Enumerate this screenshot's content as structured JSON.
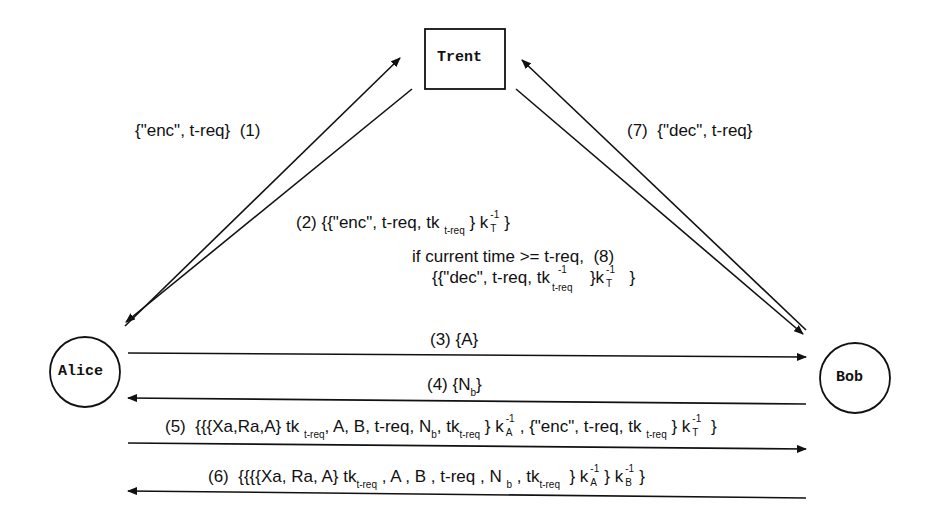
{
  "diagram": {
    "nodes": {
      "trent": "Trent",
      "alice": "Alice",
      "bob": "Bob"
    },
    "messages": {
      "m1": {
        "num": "(1)",
        "text": "{\"enc\", t-req}"
      },
      "m2": {
        "num": "(2)",
        "pre": "{{\"enc\", t-req, tk",
        "sub": "t-req",
        "mid": "} k",
        "ksup": "-1",
        "ksub": "T",
        "post": "}"
      },
      "m3": {
        "num": "(3)",
        "text": "{A}"
      },
      "m4": {
        "num": "(4)",
        "pre": "{N",
        "sub": "b",
        "post": "}"
      },
      "m5": {
        "num": "(5)",
        "p1": "{{{Xa,Ra,A} tk",
        "s1": "t-req",
        "p2": ", A, B, t-req, N",
        "s2": "b",
        "p3": ", tk",
        "s3": "t-req",
        "p4": "} k",
        "k1sup": "-1",
        "k1sub": "A",
        "p5": ", {\"enc\", t-req, tk",
        "s4": "t-req",
        "p6": "} k",
        "k2sup": "-1",
        "k2sub": "T",
        "p7": "}"
      },
      "m6": {
        "num": "(6)",
        "p1": "{{{{Xa, Ra, A} tk",
        "s1": "t-req",
        "p2": ", A , B , t-req , N",
        "s2": "b",
        "p3": ", tk",
        "s3": "t-req",
        "p4": "} k",
        "k1sup": "-1",
        "k1sub": "A",
        "p5": "} k",
        "k2sup": "-1",
        "k2sub": "B",
        "p6": "}"
      },
      "m7": {
        "num": "(7)",
        "text": "{\"dec\", t-req}"
      },
      "m8": {
        "num": "(8)",
        "cond": "if current time >= t-req,",
        "pre": "{{\"dec\", t-req, tk",
        "tksup": "-1",
        "tksub": "t-req",
        "mid": "}k",
        "ksup": "-1",
        "ksub": "T",
        "post": "}"
      }
    }
  }
}
